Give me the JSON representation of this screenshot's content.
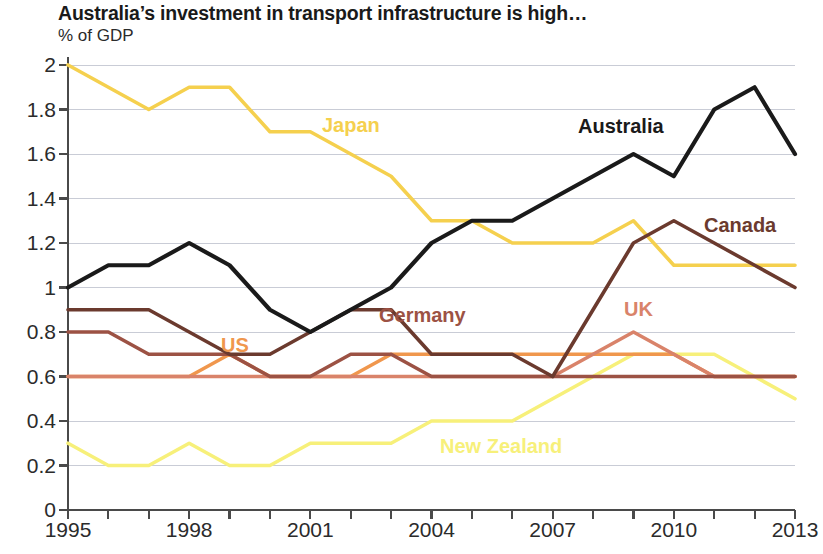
{
  "header": {
    "title": "Australia’s investment in transport infrastructure is high…",
    "subtitle": "% of GDP"
  },
  "chart_data": {
    "type": "line",
    "title": "Australia’s investment in transport infrastructure is high…",
    "subtitle": "% of GDP",
    "xlabel": "",
    "ylabel": "% of GDP",
    "xlim": [
      1995,
      2013
    ],
    "ylim": [
      0,
      2
    ],
    "ytick_step": 0.2,
    "grid": true,
    "legend_position": "inline-annotations",
    "x": [
      1995,
      1996,
      1997,
      1998,
      1999,
      2000,
      2001,
      2002,
      2003,
      2004,
      2005,
      2006,
      2007,
      2008,
      2009,
      2010,
      2011,
      2012,
      2013
    ],
    "xtick_labels": [
      "1995",
      "1998",
      "2001",
      "2004",
      "2007",
      "2010",
      "2013"
    ],
    "xtick_values": [
      1995,
      1998,
      2001,
      2004,
      2007,
      2010,
      2013
    ],
    "ytick_labels": [
      "0",
      "0.2",
      "0.4",
      "0.6",
      "0.8",
      "1",
      "1.2",
      "1.4",
      "1.6",
      "1.8",
      "2"
    ],
    "ytick_values": [
      0,
      0.2,
      0.4,
      0.6,
      0.8,
      1.0,
      1.2,
      1.4,
      1.6,
      1.8,
      2.0
    ],
    "series": [
      {
        "name": "Japan",
        "color": "#f5d04e",
        "label_x": 1995,
        "values": [
          2.0,
          1.9,
          1.8,
          1.9,
          1.9,
          1.7,
          1.7,
          1.6,
          1.5,
          1.3,
          1.3,
          1.2,
          1.2,
          1.2,
          1.3,
          1.1,
          1.1,
          1.1,
          1.1
        ]
      },
      {
        "name": "Australia",
        "color": "#1a1a1a",
        "label_x": 2008,
        "values": [
          1.0,
          1.1,
          1.1,
          1.2,
          1.1,
          0.9,
          0.8,
          0.9,
          1.0,
          1.2,
          1.3,
          1.3,
          1.4,
          1.5,
          1.6,
          1.5,
          1.8,
          1.9,
          1.6
        ]
      },
      {
        "name": "Canada",
        "color": "#6b3a2e",
        "label_x": 2010,
        "values": [
          0.9,
          0.9,
          0.9,
          0.8,
          0.7,
          0.7,
          0.8,
          0.9,
          0.9,
          0.7,
          0.7,
          0.7,
          0.6,
          0.9,
          1.2,
          1.3,
          1.2,
          1.1,
          1.0
        ]
      },
      {
        "name": "Germany",
        "color": "#9c5244",
        "label_x": 2003,
        "values": [
          0.8,
          0.8,
          0.7,
          0.7,
          0.7,
          0.6,
          0.6,
          0.7,
          0.7,
          0.6,
          0.6,
          0.6,
          0.6,
          0.6,
          0.6,
          0.6,
          0.6,
          0.6,
          0.6
        ]
      },
      {
        "name": "UK",
        "color": "#d9836a",
        "label_x": 2009,
        "values": [
          0.6,
          0.6,
          0.6,
          0.6,
          0.6,
          0.6,
          0.6,
          0.6,
          0.6,
          0.6,
          0.6,
          0.6,
          0.6,
          0.7,
          0.8,
          0.7,
          0.6,
          0.6,
          0.6
        ]
      },
      {
        "name": "US",
        "color": "#f0974d",
        "label_x": 2001,
        "values": [
          0.6,
          0.6,
          0.6,
          0.6,
          0.7,
          0.6,
          0.6,
          0.6,
          0.7,
          0.7,
          0.7,
          0.7,
          0.7,
          0.7,
          0.7,
          0.7,
          0.6,
          0.6,
          0.6
        ]
      },
      {
        "name": "New Zealand",
        "color": "#f7f07a",
        "label_x": 2004,
        "values": [
          0.3,
          0.2,
          0.2,
          0.3,
          0.2,
          0.2,
          0.3,
          0.3,
          0.3,
          0.4,
          0.4,
          0.4,
          0.5,
          0.6,
          0.7,
          0.7,
          0.7,
          0.6,
          0.5
        ]
      }
    ],
    "annotations": [
      {
        "text": "Japan",
        "color": "#f5d04e",
        "x": 322,
        "y": 114
      },
      {
        "text": "Australia",
        "color": "#1a1a1a",
        "x": 578,
        "y": 115
      },
      {
        "text": "Canada",
        "color": "#6b3a2e",
        "x": 704,
        "y": 214
      },
      {
        "text": "Germany",
        "color": "#9c5244",
        "x": 379,
        "y": 304
      },
      {
        "text": "UK",
        "color": "#d9836a",
        "x": 624,
        "y": 298
      },
      {
        "text": "US",
        "color": "#f0974d",
        "x": 221,
        "y": 334
      },
      {
        "text": "New Zealand",
        "color": "#f7f07a",
        "x": 440,
        "y": 435
      }
    ]
  }
}
